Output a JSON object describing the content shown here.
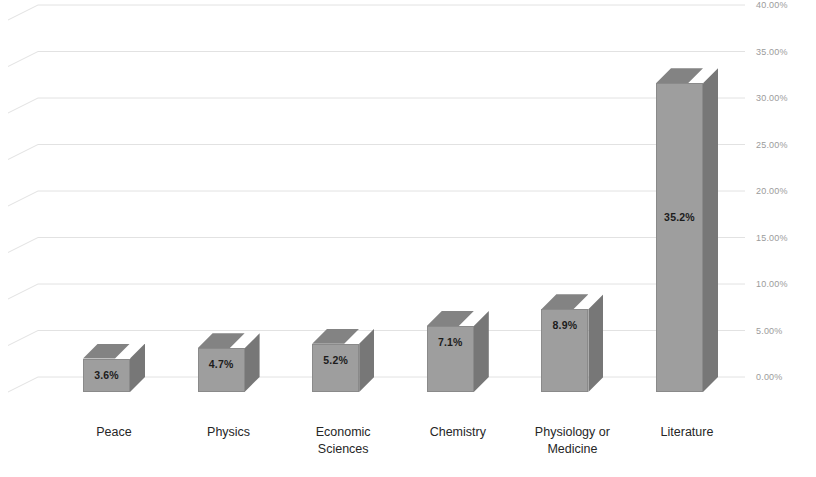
{
  "chart_data": {
    "type": "bar",
    "title": "",
    "subtitle": "",
    "xlabel": "",
    "ylabel": "",
    "categories": [
      "Peace",
      "Physics",
      "Economic Sciences",
      "Chemistry",
      "Physiology or Medicine",
      "Literature"
    ],
    "values": [
      3.6,
      4.7,
      5.2,
      7.1,
      8.9,
      35.2
    ],
    "data_labels": [
      "3.6%",
      "4.7%",
      "5.2%",
      "7.1%",
      "8.9%",
      "35.2%"
    ],
    "bar_render_pct": [
      3.6,
      4.7,
      5.2,
      7.1,
      8.9,
      33.2
    ],
    "ylim": [
      0,
      40
    ],
    "ytick_values": [
      0,
      5,
      10,
      15,
      20,
      25,
      30,
      35,
      40
    ],
    "ytick_labels": [
      "0.00%",
      "5.00%",
      "10.00%",
      "15.00%",
      "20.00%",
      "25.00%",
      "30.00%",
      "35.00%",
      "40.00%"
    ],
    "grid": true,
    "legend": false,
    "style": "3d-clustered-column",
    "colors": {
      "bar_front": "#9e9e9e",
      "bar_top": "#838383",
      "bar_side": "#777777",
      "bar_edge": "#8a8a8a",
      "gridline": "#e2e2e2",
      "axis_text": "#9b9b9b",
      "category_text": "#262626",
      "data_label_text": "#1c1c1c",
      "background": "#ffffff"
    }
  },
  "category_lines": [
    [
      "Peace"
    ],
    [
      "Physics"
    ],
    [
      "Economic",
      "Sciences"
    ],
    [
      "Chemistry"
    ],
    [
      "Physiology or",
      "Medicine"
    ],
    [
      "Literature"
    ]
  ]
}
